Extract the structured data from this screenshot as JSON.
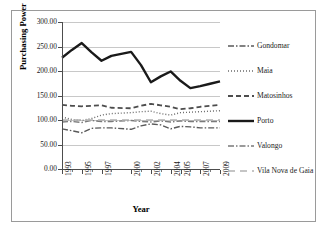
{
  "chart_data": {
    "type": "line",
    "title": "",
    "xlabel": "Year",
    "ylabel": "Purchasing Power",
    "grid": true,
    "legend_position": "right",
    "ylim": [
      0,
      300
    ],
    "ytick_labels": [
      "0.00",
      "50.00",
      "100.00",
      "150.00",
      "200.00",
      "250.00",
      "300.00"
    ],
    "ytick_values": [
      0,
      50,
      100,
      150,
      200,
      250,
      300
    ],
    "x": [
      1993,
      1994,
      1995,
      1996,
      1997,
      1998,
      2000,
      2001,
      2002,
      2003,
      2004,
      2005,
      2006,
      2007,
      2008,
      2009
    ],
    "xtick_labels": [
      "1993",
      "1995",
      "1997",
      "2000",
      "2002",
      "2004",
      "2005",
      "2007",
      "2009"
    ],
    "xtick_values": [
      1993,
      1995,
      1997,
      2000,
      2002,
      2004,
      2005,
      2007,
      2009
    ],
    "series": [
      {
        "name": "Gondomar",
        "style": "dash-dot",
        "color": "#595959",
        "width": 1.4,
        "values": [
          82,
          78,
          74,
          83,
          84,
          84,
          81,
          88,
          92,
          90,
          82,
          87,
          86,
          84,
          84,
          84
        ]
      },
      {
        "name": "Maia",
        "style": "dotted",
        "color": "#6b6b6b",
        "width": 1.4,
        "values": [
          106,
          101,
          99,
          103,
          110,
          113,
          115,
          117,
          118,
          113,
          110,
          115,
          116,
          117,
          118,
          119
        ]
      },
      {
        "name": "Matosinhos",
        "style": "dashed",
        "color": "#4d4d4d",
        "width": 1.8,
        "values": [
          131,
          129,
          128,
          129,
          130,
          125,
          124,
          129,
          133,
          130,
          127,
          122,
          124,
          127,
          129,
          131
        ]
      },
      {
        "name": "Porto",
        "style": "solid",
        "color": "#1a1a1a",
        "width": 2.4,
        "values": [
          227,
          243,
          257,
          238,
          221,
          231,
          239,
          212,
          177,
          189,
          199,
          180,
          165,
          169,
          174,
          179
        ]
      },
      {
        "name": "Valongo",
        "style": "dash-dot",
        "color": "#7a7a7a",
        "width": 1.4,
        "values": [
          96,
          97,
          95,
          99,
          97,
          97,
          99,
          97,
          96,
          98,
          96,
          98,
          97,
          97,
          97,
          97
        ]
      },
      {
        "name": "Vila Nova de Gaia",
        "style": "long-dash",
        "color": "#b3b3b3",
        "width": 1.4,
        "values": [
          100,
          100,
          100,
          100,
          100,
          100,
          100,
          100,
          100,
          100,
          100,
          100,
          100,
          100,
          100,
          100
        ]
      }
    ]
  },
  "legend": {
    "items": [
      {
        "label": "Gondomar"
      },
      {
        "label": "Maia"
      },
      {
        "label": "Matosinhos"
      },
      {
        "label": "Porto"
      },
      {
        "label": "Valongo"
      },
      {
        "label": "Vila Nova de Gaia"
      }
    ]
  }
}
